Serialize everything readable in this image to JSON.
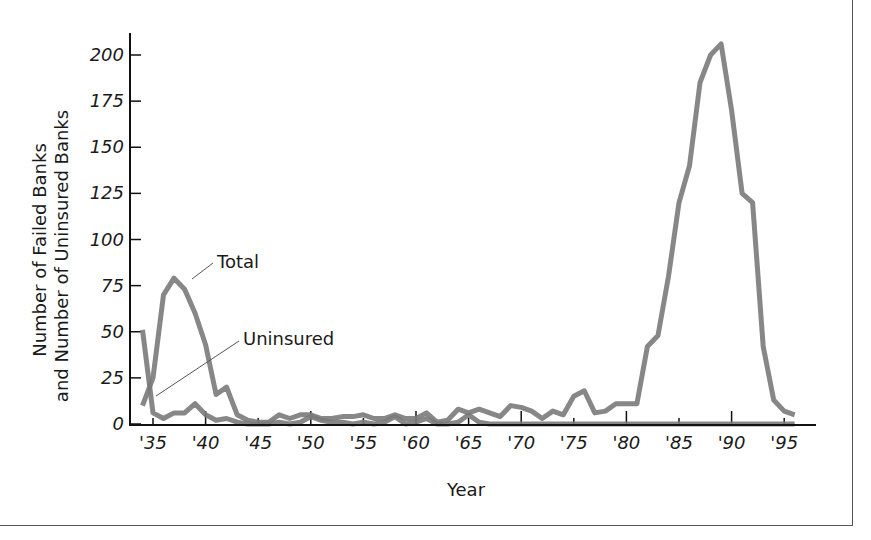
{
  "chart_data": {
    "type": "line",
    "title": "",
    "xlabel": "Year",
    "ylabel_line1": "Number of Failed Banks",
    "ylabel_line2": "and Number of Uninsured Banks",
    "xlim": [
      1934,
      1996
    ],
    "ylim": [
      0,
      210
    ],
    "x_ticks": [
      1935,
      1940,
      1945,
      1950,
      1955,
      1960,
      1965,
      1970,
      1975,
      1980,
      1985,
      1990,
      1995
    ],
    "x_tick_labels": [
      "'35",
      "'40",
      "'45",
      "'50",
      "'55",
      "'60",
      "'65",
      "'70",
      "'75",
      "'80",
      "'85",
      "'90",
      "'95"
    ],
    "y_ticks": [
      0,
      25,
      50,
      75,
      100,
      125,
      150,
      175,
      200
    ],
    "y_tick_labels": [
      "0",
      "25",
      "50",
      "75",
      "100",
      "125",
      "150",
      "175",
      "200"
    ],
    "grid": false,
    "legend": "inline annotations",
    "annotations": [
      {
        "text": "Total",
        "series": "Total"
      },
      {
        "text": "Uninsured",
        "series": "Uninsured"
      }
    ],
    "x": [
      1934,
      1935,
      1936,
      1937,
      1938,
      1939,
      1940,
      1941,
      1942,
      1943,
      1944,
      1945,
      1946,
      1947,
      1948,
      1949,
      1950,
      1951,
      1952,
      1953,
      1954,
      1955,
      1956,
      1957,
      1958,
      1959,
      1960,
      1961,
      1962,
      1963,
      1964,
      1965,
      1966,
      1967,
      1968,
      1969,
      1970,
      1971,
      1972,
      1973,
      1974,
      1975,
      1976,
      1977,
      1978,
      1979,
      1980,
      1981,
      1982,
      1983,
      1984,
      1985,
      1986,
      1987,
      1988,
      1989,
      1990,
      1991,
      1992,
      1993,
      1994,
      1995,
      1996
    ],
    "series": [
      {
        "name": "Total",
        "color": "#7a7a7a",
        "values": [
          10,
          25,
          70,
          79,
          73,
          60,
          43,
          16,
          20,
          5,
          2,
          1,
          1,
          5,
          3,
          5,
          5,
          3,
          3,
          4,
          4,
          5,
          3,
          3,
          5,
          3,
          3,
          6,
          1,
          2,
          8,
          6,
          8,
          6,
          4,
          10,
          9,
          7,
          3,
          7,
          5,
          15,
          18,
          6,
          7,
          11,
          11,
          11,
          42,
          48,
          80,
          120,
          140,
          185,
          200,
          206,
          170,
          125,
          120,
          42,
          13,
          7,
          5
        ]
      },
      {
        "name": "Uninsured",
        "color": "#7a7a7a",
        "values": [
          51,
          6,
          3,
          6,
          6,
          11,
          5,
          2,
          3,
          1,
          0,
          0,
          0,
          1,
          0,
          1,
          4,
          2,
          1,
          1,
          0,
          1,
          0,
          1,
          4,
          0,
          1,
          3,
          0,
          0,
          1,
          5,
          1,
          0,
          0,
          0,
          0,
          0,
          0,
          0,
          0,
          0,
          0,
          0,
          0,
          0,
          0,
          0,
          0,
          0,
          0,
          0,
          0,
          0,
          0,
          0,
          0,
          0,
          0,
          0,
          0,
          0,
          0
        ]
      }
    ]
  }
}
